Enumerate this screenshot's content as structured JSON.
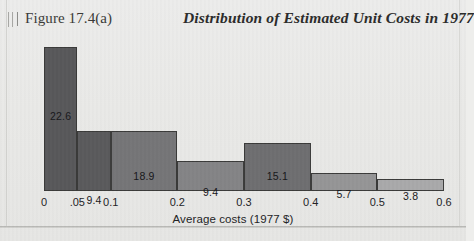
{
  "figure": {
    "number_label": "Figure 17.4(a)",
    "title": "Distribution of Estimated Unit Costs in 1977",
    "scan_marks": 3,
    "background_color": "#e9e9e7",
    "border_color": "#b9b9b6"
  },
  "chart_data": {
    "type": "bar",
    "title": "Distribution of Estimated Unit Costs in 1977",
    "xlabel": "Average costs (1977 $)",
    "ylabel": "",
    "grid": false,
    "legend": null,
    "xlim": [
      0,
      0.6
    ],
    "ylim": [
      0,
      452
    ],
    "x_ticks": [
      "0",
      ".05",
      "0.1",
      "0.2",
      "0.3",
      "0.4",
      "0.5",
      "0.6"
    ],
    "x_tick_values": [
      0,
      0.05,
      0.1,
      0.2,
      0.3,
      0.4,
      0.5,
      0.6
    ],
    "note": "Histogram of unequal-width bins; printed number on each bar is the percentage of observations in that bin (bar area), heights are densities.",
    "categories": [
      "0-.05",
      ".05-0.1",
      "0.1-0.2",
      "0.2-0.3",
      "0.3-0.4",
      "0.4-0.5",
      "0.5-0.6"
    ],
    "bin_edges": [
      0,
      0.05,
      0.1,
      0.2,
      0.3,
      0.4,
      0.5,
      0.6
    ],
    "values": [
      22.6,
      9.4,
      18.9,
      9.4,
      15.1,
      5.7,
      3.8
    ],
    "densities": [
      452,
      188,
      189,
      94,
      151,
      57,
      38
    ],
    "bars": [
      {
        "label": "22.6",
        "bin_start": 0,
        "bin_end": 0.05,
        "percent": 22.6,
        "density": 452,
        "color": "#58585a",
        "label_y_from_top": 62
      },
      {
        "label": "9.4",
        "bin_start": 0.05,
        "bin_end": 0.1,
        "percent": 9.4,
        "density": 188,
        "color": "#5a5a5c",
        "label_y_from_top": 62
      },
      {
        "label": "18.9",
        "bin_start": 0.1,
        "bin_end": 0.2,
        "percent": 18.9,
        "density": 189,
        "color": "#757577",
        "label_y_from_top": 38
      },
      {
        "label": "9.4",
        "bin_start": 0.2,
        "bin_end": 0.3,
        "percent": 9.4,
        "density": 94,
        "color": "#848486",
        "label_y_from_top": 24
      },
      {
        "label": "15.1",
        "bin_start": 0.3,
        "bin_end": 0.4,
        "percent": 15.1,
        "density": 151,
        "color": "#6e6e70",
        "label_y_from_top": 26
      },
      {
        "label": "5.7",
        "bin_start": 0.4,
        "bin_end": 0.5,
        "percent": 5.7,
        "density": 57,
        "color": "#959596",
        "label_y_from_top": 14
      },
      {
        "label": "3.8",
        "bin_start": 0.5,
        "bin_end": 0.6,
        "percent": 3.8,
        "density": 38,
        "color": "#a9a9aa",
        "label_y_from_top": 10
      }
    ]
  }
}
